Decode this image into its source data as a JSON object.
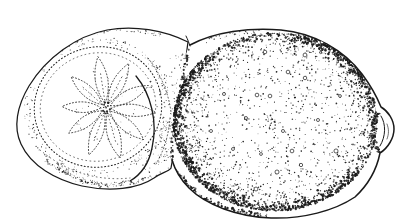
{
  "page": {
    "background_color": "#ffffff"
  },
  "illustration": {
    "title": "Lemons",
    "description": "Black-and-white pen-and-ink stipple drawing of a halved lemon with a segmented cross-section resting against a whole lemon with a dimpled peel and a pointed tip",
    "ink_color": "#1a1a1a",
    "paper_color": "#ffffff",
    "subjects": [
      {
        "id": "halved-lemon",
        "label": "Halved lemon showing citrus segment wheel"
      },
      {
        "id": "whole-lemon",
        "label": "Whole lemon with stippled peel"
      }
    ],
    "render": {
      "seed": 12,
      "wheel_center": [
        106,
        108
      ],
      "segments": [
        {
          "a": 99,
          "l": 52
        },
        {
          "a": 63,
          "l": 50
        },
        {
          "a": 28,
          "l": 48
        },
        {
          "a": -5,
          "l": 50
        },
        {
          "a": -40,
          "l": 49
        },
        {
          "a": -74,
          "l": 52
        },
        {
          "a": -110,
          "l": 50
        },
        {
          "a": -146,
          "l": 45
        },
        {
          "a": 178,
          "l": 44
        },
        {
          "a": 138,
          "l": 47
        }
      ],
      "peel_ellipse": {
        "cx": 275,
        "cy": 122,
        "rx": 102,
        "ry": 89
      },
      "rim_ellipse": {
        "cx": 98,
        "cy": 107,
        "rx": 64,
        "ry": 60,
        "rot": -15
      },
      "peel_dot_count": 2200,
      "edge_band_dot_count": 950,
      "boundary_bead_count": 130,
      "bottom_left_count": 150,
      "top_right_count": 90,
      "top_left_count": 45,
      "nipple_cluster_count": 110,
      "rind_dot_count": 240,
      "crescent_dot_count": 150,
      "back_band_count": 100,
      "half_top_edge_count": 60,
      "half_bottom_edge_count": 80,
      "pores": [
        [
          288,
          72
        ],
        [
          257,
          95
        ],
        [
          305,
          78
        ],
        [
          322,
          42
        ],
        [
          292,
          151
        ],
        [
          261,
          154
        ],
        [
          277,
          172
        ],
        [
          318,
          120
        ],
        [
          340,
          96
        ],
        [
          270,
          96
        ],
        [
          246,
          118
        ],
        [
          283,
          131
        ],
        [
          233,
          149
        ],
        [
          211,
          131
        ],
        [
          301,
          165
        ],
        [
          265,
          52
        ],
        [
          336,
          151
        ],
        [
          224,
          94
        ],
        [
          256,
          189
        ],
        [
          305,
          55
        ]
      ]
    }
  }
}
